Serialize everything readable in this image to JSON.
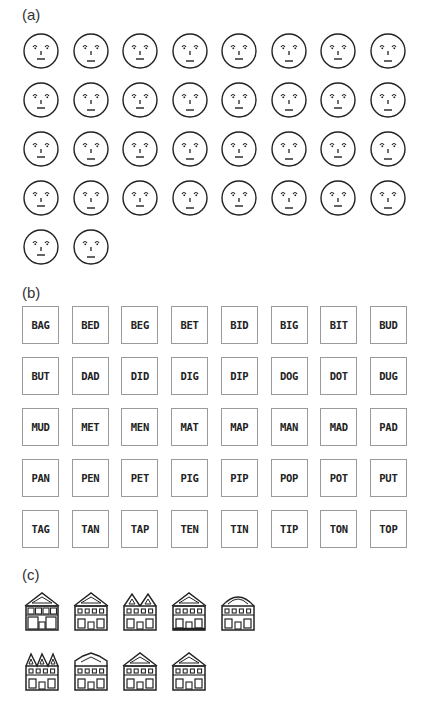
{
  "panels": {
    "a": {
      "label": "(a)",
      "rows": 5,
      "cols": 8,
      "count": 34,
      "item_type": "schematic face",
      "faces": [
        {
          "eye": "arc",
          "mouth": 0
        },
        {
          "eye": "arc",
          "mouth": 1
        },
        {
          "eye": "arc",
          "mouth": 0
        },
        {
          "eye": "arc",
          "mouth": 1
        },
        {
          "eye": "arc",
          "mouth": 0
        },
        {
          "eye": "arc",
          "mouth": 1
        },
        {
          "eye": "arc",
          "mouth": 0
        },
        {
          "eye": "arc",
          "mouth": 1
        },
        {
          "eye": "arc",
          "mouth": 0
        },
        {
          "eye": "arc",
          "mouth": 1
        },
        {
          "eye": "arc",
          "mouth": 0
        },
        {
          "eye": "arc",
          "mouth": 1
        },
        {
          "eye": "arc",
          "mouth": 0
        },
        {
          "eye": "arc",
          "mouth": 1
        },
        {
          "eye": "arc",
          "mouth": 0
        },
        {
          "eye": "arc",
          "mouth": 1
        },
        {
          "eye": "arc",
          "mouth": 0
        },
        {
          "eye": "arc",
          "mouth": 1
        },
        {
          "eye": "arc",
          "mouth": 0
        },
        {
          "eye": "arc",
          "mouth": 1
        },
        {
          "eye": "arc",
          "mouth": 0
        },
        {
          "eye": "arc",
          "mouth": 1
        },
        {
          "eye": "arc",
          "mouth": 0
        },
        {
          "eye": "arc",
          "mouth": 1
        },
        {
          "eye": "arc",
          "mouth": 0
        },
        {
          "eye": "arc",
          "mouth": 1
        },
        {
          "eye": "arc",
          "mouth": 0
        },
        {
          "eye": "arc",
          "mouth": 1
        },
        {
          "eye": "arc",
          "mouth": 0
        },
        {
          "eye": "arc",
          "mouth": 1
        },
        {
          "eye": "arc",
          "mouth": 0
        },
        {
          "eye": "arc",
          "mouth": 1
        },
        {
          "eye": "arc",
          "mouth": 0
        },
        {
          "eye": "arc",
          "mouth": 1
        }
      ]
    },
    "b": {
      "label": "(b)",
      "words": [
        "BAG",
        "BED",
        "BEG",
        "BET",
        "BID",
        "BIG",
        "BIT",
        "BUD",
        "BUT",
        "DAD",
        "DID",
        "DIG",
        "DIP",
        "DOG",
        "DOT",
        "DUG",
        "MUD",
        "MET",
        "MEN",
        "MAT",
        "MAP",
        "MAN",
        "MAD",
        "PAD",
        "PAN",
        "PEN",
        "PET",
        "PIG",
        "PIP",
        "POP",
        "POT",
        "PUT",
        "TAG",
        "TAN",
        "TAP",
        "TEN",
        "TIN",
        "TIP",
        "TON",
        "TOP"
      ]
    },
    "c": {
      "label": "(c)",
      "count": 9,
      "item_type": "schematic house",
      "houses": [
        {
          "roof": "gable",
          "windows": "big"
        },
        {
          "roof": "gable",
          "windows": "small",
          "body": "notched"
        },
        {
          "roof": "double-gable",
          "windows": "small"
        },
        {
          "roof": "gable",
          "windows": "small",
          "base": "thick"
        },
        {
          "roof": "arch",
          "windows": "small"
        },
        {
          "roof": "triple-gable",
          "windows": "small"
        },
        {
          "roof": "stepped",
          "windows": "small"
        },
        {
          "roof": "gable-eave",
          "windows": "small"
        },
        {
          "roof": "gable",
          "windows": "small"
        }
      ]
    }
  }
}
